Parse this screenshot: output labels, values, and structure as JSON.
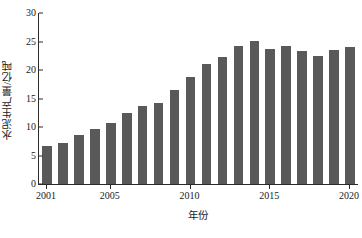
{
  "chart_data": {
    "type": "bar",
    "title": "",
    "xlabel": "年份",
    "ylabel": "水泥生产量/亿吨",
    "categories": [
      2001,
      2002,
      2003,
      2004,
      2005,
      2006,
      2007,
      2008,
      2009,
      2010,
      2011,
      2012,
      2013,
      2014,
      2015,
      2016,
      2017,
      2018,
      2019,
      2020
    ],
    "values": [
      6.6,
      7.2,
      8.6,
      9.6,
      10.7,
      12.4,
      13.6,
      14.3,
      16.5,
      18.8,
      21.1,
      22.3,
      24.3,
      25.1,
      23.6,
      24.2,
      23.4,
      22.5,
      23.5,
      24.1
    ],
    "ylim": [
      0,
      30
    ],
    "xlim": [
      2001,
      2020
    ],
    "yticks": [
      0,
      5,
      10,
      15,
      20,
      25,
      30
    ],
    "ytick_labels": [
      "0",
      "5",
      "10",
      "15",
      "20",
      "25",
      "30"
    ],
    "xticks": [
      2001,
      2005,
      2010,
      2015,
      2020
    ],
    "xtick_labels": [
      "2001",
      "2005",
      "2010",
      "2015",
      "2020"
    ],
    "grid": false,
    "legend": false,
    "bar_color": "#595959",
    "axis_color": "#2b2b2b"
  }
}
